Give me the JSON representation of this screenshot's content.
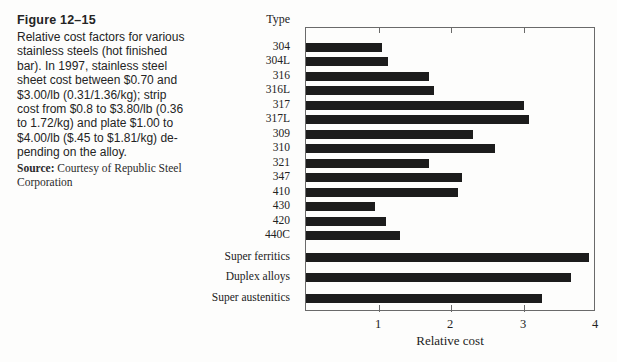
{
  "figure": {
    "label": "Figure 12–15",
    "caption": "Relative cost factors for various\nstainless steels (hot finished\nbar). In 1997, stainless steel\nsheet cost between $0.70 and\n$3.00/lb (0.31/1.36/kg); strip\ncost from $0.8 to $3.80/lb (0.36\nto 1.72/kg) and plate $1.00 to\n$4.00/lb ($.45 to $1.81/kg) de-\npending on the alloy.",
    "source_label": "Source:",
    "source_text": "Courtesy of Republic Steel\nCorporation"
  },
  "chart_data": {
    "type": "bar",
    "orientation": "horizontal",
    "header": "Type",
    "categories": [
      "304",
      "304L",
      "316",
      "316L",
      "317",
      "317L",
      "309",
      "310",
      "321",
      "347",
      "410",
      "430",
      "420",
      "440C",
      "Super ferritics",
      "Duplex alloys",
      "Super austenitics"
    ],
    "values": [
      1.05,
      1.13,
      1.7,
      1.77,
      3.0,
      3.08,
      2.3,
      2.6,
      1.7,
      2.15,
      2.1,
      0.95,
      1.1,
      1.3,
      3.9,
      3.65,
      3.25
    ],
    "title": "",
    "xlabel": "Relative cost",
    "ylabel": "Type",
    "xlim": [
      0,
      4
    ],
    "xticks": [
      1,
      2,
      3,
      4
    ],
    "grid": false,
    "legend": "none",
    "bar_color": "#1c1c1c",
    "group_gap_after_index": 13
  }
}
